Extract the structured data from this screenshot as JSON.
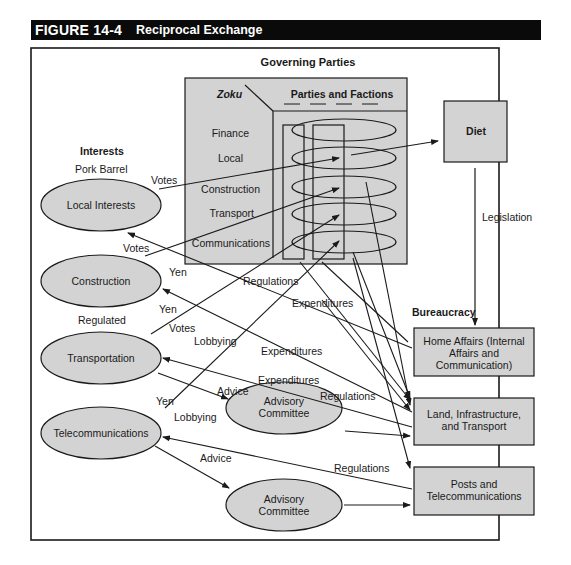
{
  "figure": {
    "number": "FIGURE 14-4",
    "title": "Reciprocal Exchange"
  },
  "colors": {
    "fill": "#d3d3d3",
    "stroke": "#1a1a1a",
    "title_bar": "#0a0a0a"
  },
  "governing_parties": {
    "heading": "Governing Parties",
    "zoku_label": "Zoku",
    "parties_label": "Parties and Factions",
    "rows": [
      "Finance",
      "Local",
      "Construction",
      "Transport",
      "Communications"
    ]
  },
  "diet": {
    "label": "Diet"
  },
  "legislation_label": "Legislation",
  "interests": {
    "heading": "Interests",
    "pork_barrel": "Pork Barrel",
    "regulated": "Regulated",
    "nodes": [
      "Local Interests",
      "Construction",
      "Transportation",
      "Telecommunications"
    ]
  },
  "advisory": {
    "line1": "Advisory",
    "line2": "Committee"
  },
  "bureaucracy": {
    "heading": "Bureaucracy",
    "home_affairs": [
      "Home Affairs (Internal",
      "Affairs and",
      "Communication)"
    ],
    "land": [
      "Land, Infrastructure,",
      "and Transport"
    ],
    "posts": [
      "Posts and",
      "Telecommunications"
    ]
  },
  "edge_labels": {
    "votes1": "Votes",
    "votes2": "Votes",
    "votes3": "Votes",
    "yen1": "Yen",
    "yen2": "Yen",
    "yen3": "Yen",
    "lobbying1": "Lobbying",
    "lobbying2": "Lobbying",
    "regulations1": "Regulations",
    "regulations2": "Regulations",
    "regulations3": "Regulations",
    "expenditures1": "Expenditures",
    "expenditures2": "Expenditures",
    "expenditures3": "Expenditures",
    "advice1": "Advice",
    "advice2": "Advice"
  }
}
